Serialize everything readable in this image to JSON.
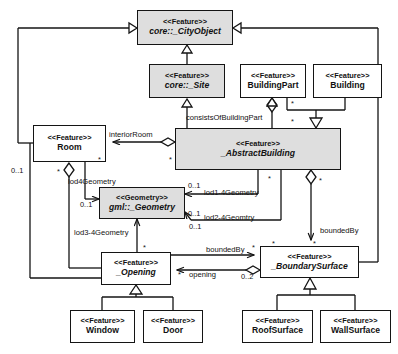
{
  "diagram": {
    "type": "uml-class-diagram",
    "stroke_color": "#141414",
    "shaded_fill": "#dedede",
    "plain_fill": "#ffffff",
    "background": "#ffffff"
  },
  "classes": [
    {
      "id": "cityobject",
      "stereotype": "<<Feature>>",
      "name": "core::_CityObject",
      "italic": true,
      "shaded": true,
      "x": 137,
      "y": 10,
      "w": 96,
      "h": 35
    },
    {
      "id": "site",
      "stereotype": "<<Feature>>",
      "name": "core::_Site",
      "italic": true,
      "shaded": true,
      "x": 149,
      "y": 64,
      "w": 76,
      "h": 34
    },
    {
      "id": "buildingpart",
      "stereotype": "<<Feature>>",
      "name": "BuildingPart",
      "italic": false,
      "shaded": false,
      "x": 240,
      "y": 64,
      "w": 66,
      "h": 34
    },
    {
      "id": "building",
      "stereotype": "<<Feature>>",
      "name": "Building",
      "italic": false,
      "shaded": false,
      "x": 313,
      "y": 64,
      "w": 69,
      "h": 34
    },
    {
      "id": "room",
      "stereotype": "<<Feature>>",
      "name": "Room",
      "italic": false,
      "shaded": false,
      "x": 33,
      "y": 125,
      "w": 73,
      "h": 37
    },
    {
      "id": "abstractbuilding",
      "stereotype": "<<Feature>>",
      "name": "_AbstractBuilding",
      "italic": true,
      "shaded": true,
      "x": 175,
      "y": 128,
      "w": 166,
      "h": 42
    },
    {
      "id": "geometry",
      "stereotype": "<<Geometry>>",
      "name": "gml::_Geometry",
      "italic": true,
      "shaded": true,
      "x": 99,
      "y": 187,
      "w": 86,
      "h": 32
    },
    {
      "id": "opening",
      "stereotype": "<<Feature>>",
      "name": "_Opening",
      "italic": true,
      "shaded": false,
      "x": 101,
      "y": 252,
      "w": 70,
      "h": 33
    },
    {
      "id": "boundarysurface",
      "stereotype": "<<Feature>>",
      "name": "_BoundarySurface",
      "italic": true,
      "shaded": false,
      "x": 260,
      "y": 246,
      "w": 99,
      "h": 32
    },
    {
      "id": "window",
      "stereotype": "<<Feature>>",
      "name": "Window",
      "italic": false,
      "shaded": false,
      "x": 70,
      "y": 310,
      "w": 65,
      "h": 33
    },
    {
      "id": "door",
      "stereotype": "<<Feature>>",
      "name": "Door",
      "italic": false,
      "shaded": false,
      "x": 143,
      "y": 310,
      "w": 60,
      "h": 33
    },
    {
      "id": "roofsurface",
      "stereotype": "<<Feature>>",
      "name": "RoofSurface",
      "italic": false,
      "shaded": false,
      "x": 242,
      "y": 310,
      "w": 71,
      "h": 33
    },
    {
      "id": "wallsurface",
      "stereotype": "<<Feature>>",
      "name": "WallSurface",
      "italic": false,
      "shaded": false,
      "x": 320,
      "y": 310,
      "w": 71,
      "h": 33
    }
  ],
  "association_labels": [
    {
      "id": "consists",
      "text": "consistsOfBuildingPart",
      "x": 186,
      "y": 113
    },
    {
      "id": "interior",
      "text": "interiorRoom",
      "x": 109,
      "y": 130
    },
    {
      "id": "lod4",
      "text": "lod4Geometry",
      "x": 68,
      "y": 177
    },
    {
      "id": "lod1_4",
      "text": "lod1-4Geometry",
      "x": 204,
      "y": 188
    },
    {
      "id": "lod2_4",
      "text": "lod2-4Geomtry",
      "x": 204,
      "y": 213
    },
    {
      "id": "lod3_4",
      "text": "lod3-4Geometry",
      "x": 74,
      "y": 228
    },
    {
      "id": "boundedby1",
      "text": "boundedBy",
      "x": 320,
      "y": 226
    },
    {
      "id": "boundedby2",
      "text": "boundedBy",
      "x": 206,
      "y": 245
    },
    {
      "id": "opening_l",
      "text": "opening",
      "x": 189,
      "y": 270
    }
  ],
  "multiplicities": [
    {
      "id": "m_bp_star",
      "text": "*",
      "x": 291,
      "y": 99
    },
    {
      "id": "m_consists",
      "text": "*",
      "x": 291,
      "y": 117
    },
    {
      "id": "m_room_star",
      "text": "*",
      "x": 98,
      "y": 155
    },
    {
      "id": "m_ab_left",
      "text": "*",
      "x": 169,
      "y": 155
    },
    {
      "id": "m_room_01",
      "text": "0..1",
      "x": 11,
      "y": 166
    },
    {
      "id": "m_room_star2",
      "text": "*",
      "x": 57,
      "y": 167
    },
    {
      "id": "m_lod1_01",
      "text": "0..1",
      "x": 188,
      "y": 181
    },
    {
      "id": "m_ab_bot_star",
      "text": "*",
      "x": 268,
      "y": 174
    },
    {
      "id": "m_ab_bot_star2",
      "text": "*",
      "x": 319,
      "y": 176
    },
    {
      "id": "m_geo_01a",
      "text": "0..1",
      "x": 80,
      "y": 200
    },
    {
      "id": "m_lod2_01",
      "text": "0..1",
      "x": 188,
      "y": 209
    },
    {
      "id": "m_geo_01b",
      "text": "0..1",
      "x": 189,
      "y": 222
    },
    {
      "id": "m_bs_top_star",
      "text": "*",
      "x": 272,
      "y": 239
    },
    {
      "id": "m_bs_r_star",
      "text": "*",
      "x": 313,
      "y": 239
    },
    {
      "id": "m_bb2_star",
      "text": "*",
      "x": 252,
      "y": 243
    },
    {
      "id": "m_open_star",
      "text": "*",
      "x": 143,
      "y": 243
    },
    {
      "id": "m_open_02",
      "text": "0..2",
      "x": 241,
      "y": 272
    },
    {
      "id": "m_open_in",
      "text": "*",
      "x": 178,
      "y": 270
    }
  ]
}
